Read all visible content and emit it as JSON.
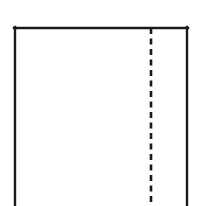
{
  "figure": {
    "title": "",
    "caption": "",
    "background_color": "#ffffff",
    "ink_color": "#1a1a1a",
    "canvas": {
      "width": 210,
      "height": 206
    }
  },
  "chart_data": {
    "type": "diagram",
    "title": "",
    "subtitle": "",
    "xlabel": "",
    "ylabel": "",
    "annotations": [],
    "legend": [],
    "shapes": [
      {
        "id": "outline-top-edge",
        "name": "top-edge",
        "kind": "line",
        "style": "solid",
        "stroke_color": "#1a1a1a",
        "stroke_width": 2.4,
        "x1": 14,
        "y1": 28,
        "x2": 188,
        "y2": 28,
        "label": ""
      },
      {
        "id": "outline-left-edge",
        "name": "left-edge",
        "kind": "line",
        "style": "solid",
        "stroke_color": "#1a1a1a",
        "stroke_width": 2.4,
        "x1": 15,
        "y1": 27,
        "x2": 15,
        "y2": 206,
        "label": ""
      },
      {
        "id": "outline-right-edge",
        "name": "right-edge",
        "kind": "line",
        "style": "solid",
        "stroke_color": "#1a1a1a",
        "stroke_width": 2.4,
        "x1": 187,
        "y1": 27,
        "x2": 187,
        "y2": 206,
        "label": ""
      },
      {
        "id": "fold-line",
        "name": "dashed-fold-line",
        "kind": "line",
        "style": "dashed",
        "stroke_color": "#1a1a1a",
        "stroke_width": 2.6,
        "dash_length": 6,
        "gap_length": 4.5,
        "x1": 151,
        "y1": 28,
        "x2": 151,
        "y2": 206,
        "label": ""
      }
    ],
    "notes": [
      "No bottom edge is drawn; the rectangle runs off the bottom of the frame.",
      "The dashed line divides the shape into a wide left panel and a narrow right panel."
    ]
  }
}
